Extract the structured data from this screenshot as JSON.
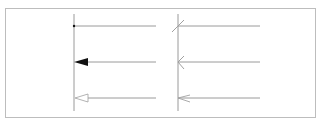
{
  "diagram": {
    "title": "",
    "colors": {
      "frame": "#bdbdbd",
      "line": "#9a9a9a",
      "filled": "#111111",
      "cross": "#a0a0a0"
    },
    "columns": [
      {
        "axis_x": 74,
        "rows": [
          {
            "style": "dot",
            "y": 26
          },
          {
            "style": "filled-triangle",
            "y": 62
          },
          {
            "style": "open-triangle",
            "y": 98
          }
        ]
      },
      {
        "axis_x": 178,
        "rows": [
          {
            "style": "slash",
            "y": 26
          },
          {
            "style": "open-arrow",
            "y": 62
          },
          {
            "style": "narrow-open-arrow",
            "y": 98
          }
        ]
      }
    ]
  }
}
